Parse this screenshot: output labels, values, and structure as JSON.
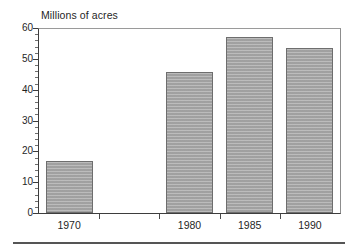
{
  "chart_data": {
    "type": "bar",
    "title": "Millions of acres",
    "subtitle": "",
    "xlabel": "",
    "ylabel": "",
    "categories": [
      "1970",
      "1980",
      "1985",
      "1990"
    ],
    "values": [
      17,
      45.7,
      57,
      53.5
    ],
    "series": [
      {
        "name": "Millions of acres",
        "values": [
          17,
          45.7,
          57,
          53.5
        ]
      }
    ],
    "ylim": [
      0,
      60
    ],
    "y_ticks": [
      "0",
      "10",
      "20",
      "30",
      "40",
      "50",
      "60"
    ],
    "y_tick_values": [
      0,
      10,
      20,
      30,
      40,
      50,
      60
    ],
    "y_minor_tick_interval": 2,
    "x_ticks": [
      "1970",
      "1980",
      "1985",
      "1990"
    ],
    "grid": false,
    "legend": false,
    "legend_position": "none",
    "bar_color": "#a9a9a9",
    "bar_edge_color": "#6e6e6e",
    "axis_color": "#3d3d3d",
    "background_color": "#ffffff",
    "annotations": []
  },
  "figure": {
    "title_text": "Millions of acres",
    "bottom_rule_color": "#555555"
  }
}
